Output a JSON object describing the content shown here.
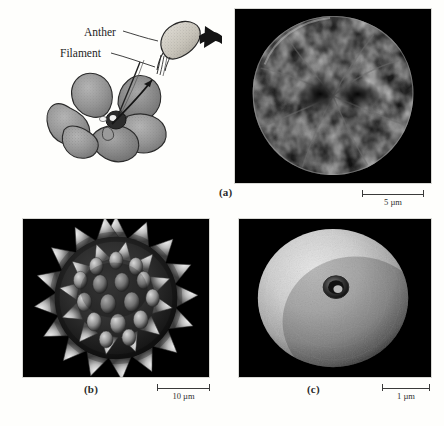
{
  "figure": {
    "illustration": {
      "name": "flower-with-stamen-detail",
      "labels": {
        "anther": "Anther",
        "filament": "Filament"
      }
    },
    "panels": [
      {
        "id": "a",
        "label": "(a)",
        "subject": "pollen-grain-reticulate",
        "scalebar": {
          "value": "5",
          "unit": "µm",
          "text": "5 µm"
        }
      },
      {
        "id": "b",
        "label": "(b)",
        "subject": "pollen-grain-echinate",
        "scalebar": {
          "value": "10",
          "unit": "µm",
          "text": "10 µm"
        }
      },
      {
        "id": "c",
        "label": "(c)",
        "subject": "pollen-grain-smooth-porate",
        "scalebar": {
          "value": "1",
          "unit": "µm",
          "text": "1 µm"
        }
      }
    ],
    "colors": {
      "page_background": "#fefefc",
      "micrograph_background": "#000000",
      "ink": "#1d1d1d",
      "petal_gray": "#8f8f8f"
    }
  }
}
